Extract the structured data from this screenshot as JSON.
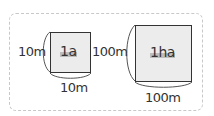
{
  "small_square": {
    "area_label": "1a",
    "side_left": "10m",
    "side_bottom": "10m"
  },
  "large_square": {
    "area_label": "1ha",
    "side_left": "100m",
    "side_bottom": "100m"
  },
  "colors": {
    "square_fill": "#ececec",
    "square_border": "#333333",
    "frame_border": "#c8c8c8",
    "highlight": "#bdbdbd"
  }
}
